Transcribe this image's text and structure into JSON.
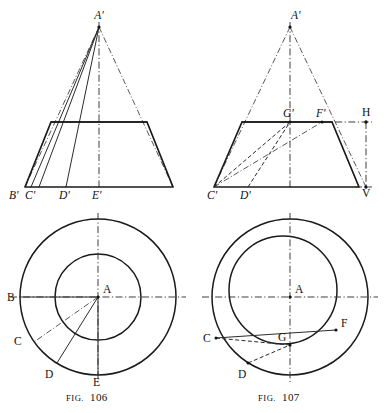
{
  "plate": {
    "background_color": "#ffffff",
    "ink_color": "#1a1a1a",
    "figures": [
      {
        "id": "fig-106",
        "caption_prefix": "FIG.",
        "caption_number": "106",
        "elevation": {
          "apex_label": "A'",
          "base_labels": [
            "B'",
            "C'",
            "D'",
            "E'"
          ]
        },
        "plan": {
          "center_label": "A",
          "point_labels": [
            "B",
            "C",
            "D",
            "E"
          ]
        }
      },
      {
        "id": "fig-107",
        "caption_prefix": "FIG.",
        "caption_number": "107",
        "elevation": {
          "apex_label": "A'",
          "base_labels": [
            "C'",
            "D'"
          ],
          "top_labels": [
            "G'",
            "F'"
          ],
          "reference_labels": [
            "H",
            "V"
          ]
        },
        "plan": {
          "center_label": "A",
          "point_labels": [
            "C",
            "D",
            "G",
            "F"
          ]
        }
      }
    ]
  },
  "labels": {
    "f106_apex": "A'",
    "f106_b_prime": "B'",
    "f106_c_prime": "C'",
    "f106_d_prime": "D'",
    "f106_e_prime": "E'",
    "f106_center": "A",
    "f106_b": "B",
    "f106_c": "C",
    "f106_d": "D",
    "f106_e": "E",
    "f106_caption_prefix": "FIG.",
    "f106_caption_number": "106",
    "f107_apex": "A'",
    "f107_c_prime": "C'",
    "f107_d_prime": "D'",
    "f107_g_prime": "G'",
    "f107_f_prime": "F'",
    "f107_h": "H",
    "f107_v": "V",
    "f107_center": "A",
    "f107_c": "C",
    "f107_d": "D",
    "f107_g": "G",
    "f107_f": "F",
    "f107_caption_prefix": "FIG.",
    "f107_caption_number": "107"
  }
}
